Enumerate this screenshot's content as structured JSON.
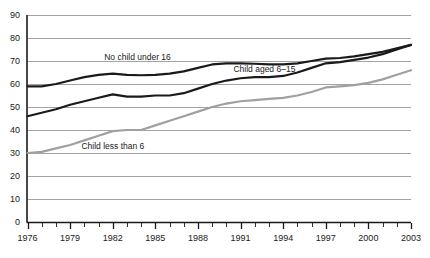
{
  "chart_data": {
    "type": "line",
    "title": "",
    "xlabel": "",
    "ylabel": "",
    "ylim": [
      0,
      90
    ],
    "xlim": [
      1976,
      2003
    ],
    "grid": true,
    "grid_axis": "y",
    "legend_position": "inline-annotations",
    "ytick_labels": [
      "90",
      "80",
      "70",
      "60",
      "50",
      "40",
      "30",
      "20",
      "10",
      "0"
    ],
    "ytick_values": [
      90,
      80,
      70,
      60,
      50,
      40,
      30,
      20,
      10,
      0
    ],
    "xtick_labels": [
      "1976",
      "1979",
      "1982",
      "1985",
      "1988",
      "1991",
      "1994",
      "1997",
      "2000",
      "2003"
    ],
    "xtick_values": [
      1976,
      1979,
      1982,
      1985,
      1988,
      1991,
      1994,
      1997,
      2000,
      2003
    ],
    "x": [
      1976,
      1977,
      1978,
      1979,
      1980,
      1981,
      1982,
      1983,
      1984,
      1985,
      1986,
      1987,
      1988,
      1989,
      1990,
      1991,
      1992,
      1993,
      1994,
      1995,
      1996,
      1997,
      1998,
      1999,
      2000,
      2001,
      2002,
      2003
    ],
    "series": [
      {
        "name": "No child under 16",
        "color": "#1a1a1a",
        "width": 2.2,
        "label_x": 1981.4,
        "label_y": 71.5,
        "values": [
          59.0,
          59.0,
          60.0,
          61.5,
          63.0,
          64.0,
          64.5,
          64.0,
          63.8,
          64.0,
          64.5,
          65.5,
          67.0,
          68.5,
          69.0,
          69.0,
          68.8,
          68.5,
          68.5,
          69.0,
          70.0,
          71.0,
          71.3,
          72.0,
          73.0,
          74.0,
          75.5,
          77.0
        ]
      },
      {
        "name": "Child aged 6–15",
        "color": "#1a1a1a",
        "width": 2.2,
        "label_x": 1990.5,
        "label_y": 66.0,
        "values": [
          46.0,
          47.5,
          49.0,
          51.0,
          52.5,
          54.0,
          55.5,
          54.5,
          54.5,
          55.0,
          55.0,
          56.0,
          58.0,
          60.0,
          61.5,
          62.5,
          63.0,
          63.0,
          63.5,
          65.0,
          67.0,
          69.0,
          69.5,
          70.5,
          71.5,
          73.0,
          75.0,
          77.0
        ]
      },
      {
        "name": "Child less than 6",
        "color": "#a0a0a0",
        "width": 2.2,
        "label_x": 1979.8,
        "label_y": 32.5,
        "values": [
          30.0,
          30.5,
          32.0,
          33.5,
          35.5,
          37.5,
          39.5,
          40.0,
          40.0,
          42.0,
          44.0,
          46.0,
          48.0,
          50.0,
          51.5,
          52.5,
          53.0,
          53.5,
          54.0,
          55.0,
          56.5,
          58.5,
          59.0,
          59.5,
          60.5,
          62.0,
          64.0,
          66.0
        ]
      }
    ]
  },
  "axis": {
    "y_axis_color": "#1a1a1a",
    "x_axis_color": "#1a1a1a",
    "grid_color": "#8c8c8c"
  }
}
